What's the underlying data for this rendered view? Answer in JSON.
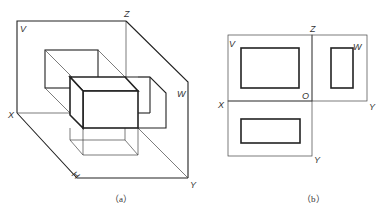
{
  "figure_a": {
    "caption": "（a）",
    "labels": {
      "v": "V",
      "z": "Z",
      "w": "W",
      "x": "X",
      "h": "H",
      "y": "Y"
    }
  },
  "figure_b": {
    "caption": "（b）",
    "labels": {
      "v": "V",
      "z": "Z",
      "w": "W",
      "x": "X",
      "o": "O",
      "y_right": "Y",
      "y_bottom": "Y"
    }
  },
  "colors": {
    "line": "#222222",
    "background": "#ffffff"
  }
}
